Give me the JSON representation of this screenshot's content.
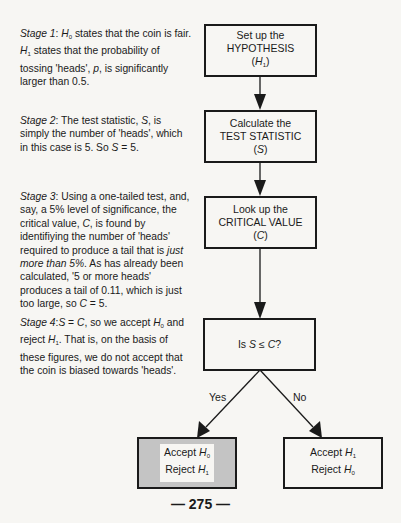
{
  "stages": [
    {
      "label": "Stage 1",
      "text_parts": [
        ": ",
        "H0",
        " states that the coin is fair.  ",
        "H1",
        " states that the probability of tossing 'heads', ",
        "p",
        ", is significantly larger than 0.5."
      ]
    },
    {
      "label": "Stage 2",
      "text": "The test statistic, S, is simply the number of 'heads', which in this case is 5.  So S = 5."
    },
    {
      "label": "Stage 3",
      "text": "Using a one-tailed test, and, say, a 5% level of significance, the critical value, C, is found by identifiying the number of 'heads' required to produce a tail that is just more than 5%.  As has already been calculated, '5 or more heads' produces a tail of 0.11, which is just too large, so C = 5."
    },
    {
      "label": "Stage 4",
      "text": "S = C, so we accept H0 and reject H1.  That is, on the basis of these figures, we do not accept that the coin is biased towards 'heads'."
    }
  ],
  "s1": {
    "a": ": ",
    "h0": "H",
    "h0sub": "0",
    "b": " states that the coin is fair.  ",
    "h1": "H",
    "h1sub": "1",
    "c": " states that the probability of tossing 'heads', ",
    "p": "p",
    "d": ", is significantly larger than 0.5."
  },
  "s2": {
    "a": ": The test statistic, ",
    "S": "S",
    "b": ", is simply the number of 'heads', which in this case is 5.  So ",
    "S2": "S",
    "c": " = 5."
  },
  "s3": {
    "a": ": Using a one-tailed test, and, say, a 5% level of significance, the critical value, ",
    "C": "C",
    "b": ", is found by identifiying the number of 'heads' required to produce a tail that is ",
    "em": "just more than 5%",
    "c": ".  As has already been calculated, '5 or more heads' produces a tail of 0.11, which is just too large, so ",
    "C2": "C",
    "d": " = 5."
  },
  "s4": {
    "a": ":",
    "S": "S",
    "b": " = ",
    "C": "C",
    "c": ", so we accept ",
    "h0": "H",
    "h0sub": "0",
    "d": " and reject ",
    "h1": "H",
    "h1sub": "1",
    "e": ".  That is, on the basis of these figures, we do not accept that the coin is biased towards 'heads'."
  },
  "flow": {
    "box1": {
      "line1": "Set up the",
      "line2": "HYPOTHESIS",
      "sym": "H",
      "sub": "1"
    },
    "box2": {
      "line1": "Calculate the",
      "line2": "TEST STATISTIC",
      "sym": "S"
    },
    "box3": {
      "line1": "Look up the",
      "line2": "CRITICAL VALUE",
      "sym": "C"
    },
    "decision": {
      "pre": "Is ",
      "S": "S",
      "op": " ≤ ",
      "C": "C",
      "post": "?"
    },
    "yes_label": "Yes",
    "no_label": "No",
    "left": {
      "accept": "Accept ",
      "accept_sym": "H",
      "accept_sub": "0",
      "reject": "Reject ",
      "reject_sym": "H",
      "reject_sub": "1"
    },
    "right": {
      "accept": "Accept ",
      "accept_sym": "H",
      "accept_sub": "1",
      "reject": "Reject ",
      "reject_sym": "H",
      "reject_sub": "0"
    }
  },
  "page_number": "— 275 —"
}
